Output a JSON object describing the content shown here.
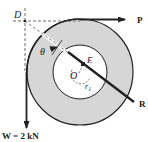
{
  "diagram": {
    "labels": {
      "D": "D",
      "P": "P",
      "theta": "θ",
      "E": "E",
      "O": "O",
      "r1": "r",
      "r1_sub": "1",
      "R": "R",
      "W": "W = 2 kN"
    },
    "colors": {
      "ring_fill": "#d6d6d6",
      "inner_fill": "#ffffff",
      "stroke": "#222222",
      "dashed": "#444444"
    }
  }
}
